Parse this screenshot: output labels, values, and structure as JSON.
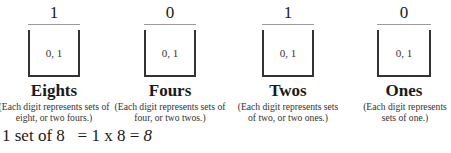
{
  "columns": [
    {
      "digit": "1",
      "box_values": "0, 1",
      "place": "Eights",
      "description": "(Each digit represents sets of eight, or two fours.)"
    },
    {
      "digit": "0",
      "box_values": "0, 1",
      "place": "Fours",
      "description": "(Each digit represents sets of four, or two twos.)"
    },
    {
      "digit": "1",
      "box_values": "0, 1",
      "place": "Twos",
      "description": "(Each digit represents sets of two, or two ones.)"
    },
    {
      "digit": "0",
      "box_values": "0, 1",
      "place": "Ones",
      "description": "(Each digit represents sets of one.)"
    }
  ],
  "equation": {
    "left": "1 set of 8   = 1 x 8 = ",
    "result": "8"
  }
}
